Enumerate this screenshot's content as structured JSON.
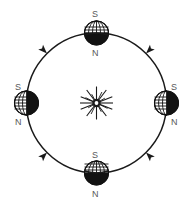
{
  "diagram": {
    "background_color": "#ffffff",
    "stroke_color": "#1a1a1a",
    "label_color": "#585858",
    "sun": {
      "name": "Sun",
      "center_x": 96.5,
      "center_y": 103,
      "core_radius": 4.2,
      "ray_count": 16,
      "ray_long": 14.5,
      "ray_short": 9.5
    },
    "orbit": {
      "name": "Earth orbital path",
      "shape": "circle",
      "center_x": 96.5,
      "center_y": 103,
      "radius": 70,
      "stroke_width": 1.5,
      "direction": "counterclockwise"
    },
    "arrows": [
      {
        "id": "arrow-top-left",
        "position_label": "top-left",
        "angle_deg": 135,
        "direction": "counterclockwise"
      },
      {
        "id": "arrow-top-right",
        "position_label": "top-right",
        "angle_deg": 45,
        "direction": "counterclockwise"
      },
      {
        "id": "arrow-bottom-right",
        "position_label": "bottom-right",
        "angle_deg": 315,
        "direction": "counterclockwise"
      },
      {
        "id": "arrow-bottom-left",
        "position_label": "bottom-left",
        "angle_deg": 225,
        "direction": "counterclockwise"
      }
    ],
    "earth_positions": [
      {
        "id": "earth-top",
        "position_label": "top",
        "center_x": 96.5,
        "center_y": 33,
        "radius": 12,
        "shadow_side": "bottom",
        "lit_side": "top",
        "labels": {
          "south": "S",
          "north": "N"
        },
        "south_label_x": 92,
        "south_label_y": 10,
        "north_label_x": 92,
        "north_label_y": 49
      },
      {
        "id": "earth-right",
        "position_label": "right",
        "center_x": 166.5,
        "center_y": 103,
        "radius": 12,
        "shadow_side": "right",
        "lit_side": "left",
        "labels": {
          "south": "S",
          "north": "N"
        },
        "south_label_x": 170,
        "south_label_y": 83,
        "north_label_x": 170,
        "north_label_y": 118
      },
      {
        "id": "earth-bottom",
        "position_label": "bottom",
        "center_x": 96.5,
        "center_y": 173,
        "radius": 12,
        "shadow_side": "bottom",
        "lit_side": "top",
        "labels": {
          "south": "S",
          "north": "N"
        },
        "south_label_x": 92,
        "south_label_y": 151,
        "north_label_x": 92,
        "north_label_y": 190
      },
      {
        "id": "earth-left",
        "position_label": "left",
        "center_x": 26.5,
        "center_y": 103,
        "radius": 12,
        "shadow_side": "left",
        "lit_side": "right",
        "labels": {
          "south": "S",
          "north": "N"
        },
        "south_label_x": 18,
        "south_label_y": 83,
        "north_label_x": 18,
        "north_label_y": 118
      }
    ]
  }
}
